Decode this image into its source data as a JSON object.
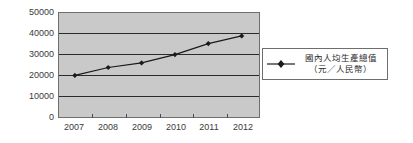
{
  "chart_data": {
    "type": "line",
    "title": "",
    "subtitle": "",
    "xlabel": "",
    "ylabel": "",
    "categories": [
      "2007",
      "2008",
      "2009",
      "2010",
      "2011",
      "2012"
    ],
    "series": [
      {
        "name": "國內人均生產總值（元／人民幣）",
        "values": [
          20000,
          23800,
          26000,
          30000,
          35300,
          39000
        ],
        "marker": "diamond",
        "color": "#1a1a1a"
      }
    ],
    "ylim": [
      0,
      50000
    ],
    "yticks": [
      0,
      10000,
      20000,
      30000,
      40000,
      50000
    ],
    "ytick_labels": [
      "0",
      "10000",
      "20000",
      "30000",
      "40000",
      "50000"
    ],
    "xtick_labels": [
      "2007",
      "2008",
      "2009",
      "2010",
      "2011",
      "2012"
    ],
    "grid": true,
    "grid_axis": "y",
    "legend_position": "right",
    "plot_background": "#c9c9c9",
    "figure_background": "#ffffff",
    "axis_color": "#6e6e6e",
    "gridline_color": "#2b2b2b"
  },
  "legend": {
    "entries": [
      {
        "label_line1": "國內人均生產總值",
        "label_line2": "（元／人民幣）",
        "marker_name": "diamond-line-marker"
      }
    ]
  }
}
